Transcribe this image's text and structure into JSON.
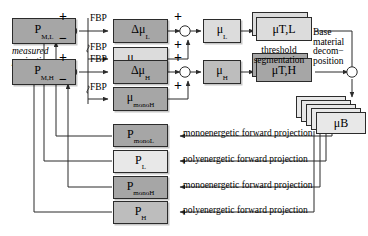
{
  "figure": {
    "accent_dark": "#a6a6a6",
    "accent_mid": "#bdbdbd",
    "accent_light": "#dcdcdc",
    "accent_pale": "#e8e8e8",
    "line_color": "#2b2b2b"
  },
  "inputs": {
    "measured_low": {
      "base": "P",
      "sub": "M,L"
    },
    "measured_high": {
      "base": "P",
      "sub": "M,H"
    },
    "caption": "measured\nprojections",
    "caption_line1": "measured",
    "caption_line2": "projections"
  },
  "operators": {
    "fbp": "FBP",
    "fbp_count": 4,
    "plus": "+",
    "minus": "−"
  },
  "reconstructions": [
    {
      "base": "Δμ",
      "sub": "L",
      "shade": "dark"
    },
    {
      "base": "μ",
      "sub": "monoL",
      "shade": "light"
    },
    {
      "base": "Δμ",
      "sub": "H",
      "shade": "dark"
    },
    {
      "base": "μ",
      "sub": "monoH",
      "shade": "dark"
    }
  ],
  "sums": [
    {
      "base": "μ",
      "sub": "L",
      "shade": "light"
    },
    {
      "base": "μ",
      "sub": "H",
      "shade": "mid"
    }
  ],
  "thresholded": [
    {
      "base": "μ",
      "sub": "T,L",
      "shade": "light"
    },
    {
      "base": "μ",
      "sub": "T,H",
      "shade": "dark"
    }
  ],
  "threshold_caption_line1": "threshold",
  "threshold_caption_line2": "segmentation",
  "decomposition": {
    "line1": "Base",
    "line2": "material",
    "line3": "decom−",
    "line4": "position",
    "output": {
      "base": "μ",
      "sub": "B",
      "shade": "pale"
    }
  },
  "projections": [
    {
      "base": "P",
      "sub": "monoL",
      "shade": "dark",
      "label": "monoenergetic forward projection"
    },
    {
      "base": "P",
      "sub": "L",
      "shade": "pale",
      "label": "polyenergetic forward projection"
    },
    {
      "base": "P",
      "sub": "monoH",
      "shade": "dark",
      "label": "monoenergetic forward projection"
    },
    {
      "base": "P",
      "sub": "H",
      "shade": "mid",
      "label": "polyenergetic forward projection"
    }
  ]
}
